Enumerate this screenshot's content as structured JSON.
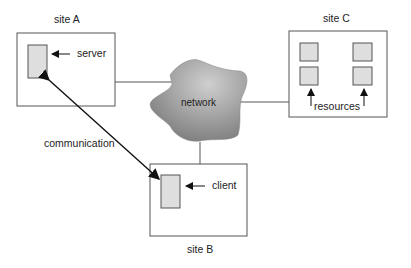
{
  "diagram": {
    "sites": {
      "a": {
        "label": "site A",
        "component": "server"
      },
      "b": {
        "label": "site B",
        "component": "client"
      },
      "c": {
        "label": "site C",
        "component": "resources"
      }
    },
    "network": {
      "label": "network"
    },
    "link": {
      "label": "communication"
    }
  },
  "colors": {
    "box_fill": "#dedede",
    "stroke": "#555555",
    "network_light": "#c8c8c8",
    "network_dark": "#7a7a7a"
  }
}
